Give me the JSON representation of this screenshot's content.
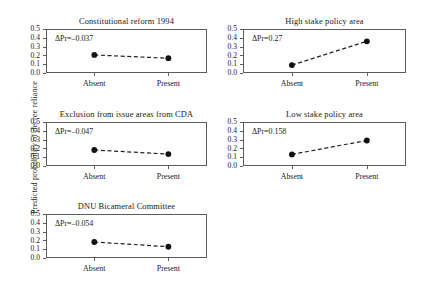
{
  "chart_data": {
    "type": "line",
    "title": "",
    "xlabel": "",
    "ylabel": "Predicted probability of decree reliance",
    "categories": [
      "Absent",
      "Present"
    ],
    "ylim": [
      0.0,
      0.5
    ],
    "yticks": [
      "0.0",
      "0.1",
      "0.2",
      "0.3",
      "0.4",
      "0.5"
    ],
    "ytick_values": [
      0.0,
      0.1,
      0.2,
      0.3,
      0.4,
      0.5
    ],
    "grid": false,
    "legend": "none",
    "marker": "filled-circle",
    "line_style": "dashed",
    "panels": [
      {
        "id": "constitutional-reform-1994",
        "title": "Constitutional reform 1994",
        "annotation": "ΔPr=–0.037",
        "values": [
          0.205,
          0.168
        ],
        "row": 0,
        "col": 0
      },
      {
        "id": "high-stake-policy-area",
        "title": "High stake policy area",
        "annotation": "ΔPr=0.27",
        "values": [
          0.09,
          0.36
        ],
        "row": 0,
        "col": 1
      },
      {
        "id": "exclusion-from-issue-areas-from-cda",
        "title": "Exclusion from issue areas from CDA",
        "annotation": "ΔPr=–0.047",
        "values": [
          0.182,
          0.135
        ],
        "row": 1,
        "col": 0
      },
      {
        "id": "low-stake-policy-area",
        "title": "Low stake policy area",
        "annotation": "ΔPr=0.158",
        "values": [
          0.132,
          0.29
        ],
        "row": 1,
        "col": 1
      },
      {
        "id": "dnu-bicameral-committee",
        "title": "DNU Bicameral Committee",
        "annotation": "ΔPr=–0.054",
        "values": [
          0.182,
          0.128
        ],
        "row": 2,
        "col": 0
      }
    ],
    "colors": {
      "marker": "#111111",
      "line": "#222222",
      "axis": "#5c5c5c",
      "text": "#1a1a1a",
      "background": "#ffffff"
    }
  }
}
